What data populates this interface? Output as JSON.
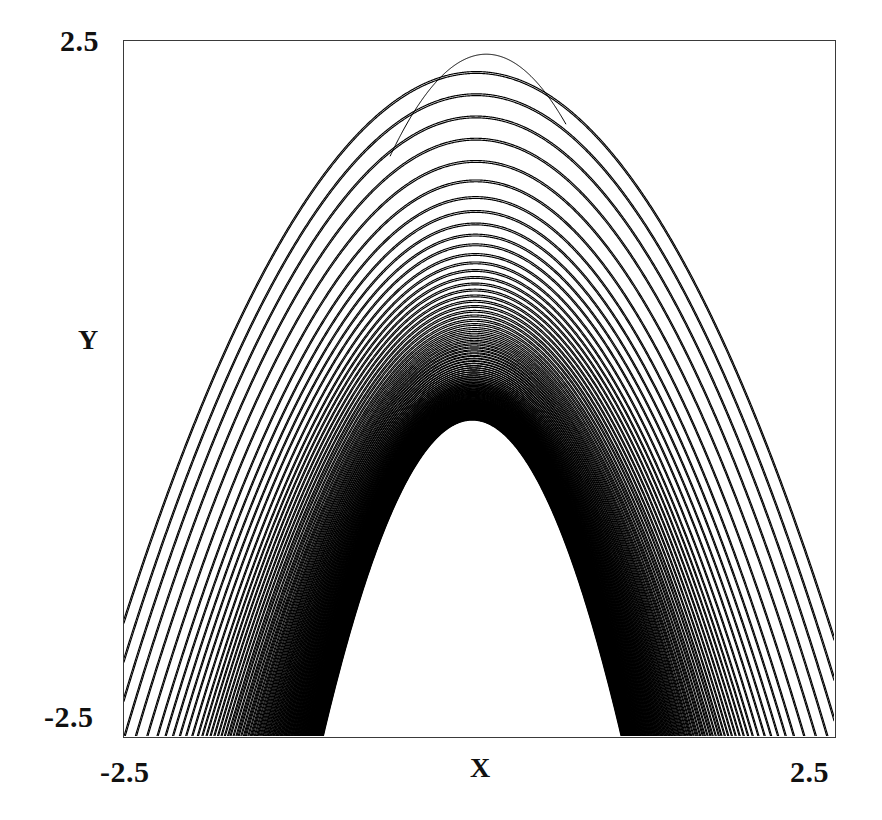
{
  "figure": {
    "background": "#ffffff",
    "frame_color": "#3a3a3a",
    "curve_color": "#000000"
  },
  "axes": {
    "x_label": "X",
    "y_label": "Y",
    "x_min_tick": "-2.5",
    "x_max_tick": "2.5",
    "y_min_tick": "-2.5",
    "y_max_tick": "2.5"
  },
  "chart_data": {
    "type": "line",
    "title": "",
    "xlabel": "X",
    "ylabel": "Y",
    "xlim": [
      -2.5,
      2.5
    ],
    "ylim": [
      -2.5,
      2.5
    ],
    "xticks": [
      -2.5,
      2.5
    ],
    "yticks": [
      -2.5,
      2.5
    ],
    "xticklabels": [
      "-2.5",
      "2.5"
    ],
    "yticklabels": [
      "-2.5",
      "2.5"
    ],
    "grid": false,
    "legend": false,
    "legend_position": "none",
    "line_color": "#000000",
    "line_width": 1.15,
    "series": [
      {
        "name": "contour-family",
        "note": "Each curve is y = apex_y - curvature*(x - vertex_x)^2 with a small shear term; apex_y values listed below in data coordinates.",
        "vertex_x": -0.005,
        "apex_y": [
          2.28,
          2.12,
          1.96,
          1.8,
          1.64,
          1.5,
          1.38,
          1.28,
          1.19,
          1.11,
          1.04,
          0.97,
          0.91,
          0.855,
          0.805,
          0.758,
          0.714,
          0.672,
          0.633,
          0.596,
          0.561,
          0.528,
          0.496,
          0.466,
          0.437,
          0.41,
          0.384,
          0.359,
          0.335,
          0.312,
          0.29,
          0.269,
          0.249,
          0.23,
          0.212,
          0.194,
          0.177,
          0.161,
          0.146,
          0.131,
          0.117,
          0.103,
          0.09,
          0.078,
          0.066,
          0.054,
          0.043,
          0.033,
          0.023,
          0.013,
          0.004,
          -0.005,
          -0.014,
          -0.022,
          -0.03,
          -0.038,
          -0.045,
          -0.052,
          -0.059,
          -0.065,
          -0.072,
          -0.078,
          -0.083,
          -0.089,
          -0.094,
          -0.1,
          -0.105,
          -0.11,
          -0.114,
          -0.119,
          -0.124,
          -0.128,
          -0.132,
          -0.136,
          -0.14,
          -0.144,
          -0.148,
          -0.152,
          -0.156,
          -0.159,
          -0.163,
          -0.166,
          -0.17,
          -0.173,
          -0.176,
          -0.179,
          -0.182,
          -0.185,
          -0.188,
          -0.191,
          -0.194,
          -0.197,
          -0.2,
          -0.202,
          -0.205,
          -0.208,
          -0.21,
          -0.213,
          -0.215,
          -0.218
        ],
        "curvature": [
          0.64,
          0.66,
          0.68,
          0.7,
          0.72,
          0.745,
          0.77,
          0.79,
          0.81,
          0.83,
          0.85,
          0.87,
          0.89,
          0.905,
          0.92,
          0.935,
          0.95,
          0.965,
          0.98,
          0.995,
          1.01,
          1.02,
          1.035,
          1.05,
          1.06,
          1.075,
          1.09,
          1.1,
          1.115,
          1.13,
          1.14,
          1.155,
          1.17,
          1.18,
          1.195,
          1.21,
          1.22,
          1.235,
          1.25,
          1.26,
          1.275,
          1.29,
          1.3,
          1.315,
          1.33,
          1.34,
          1.355,
          1.37,
          1.38,
          1.395,
          1.41,
          1.42,
          1.435,
          1.45,
          1.46,
          1.475,
          1.49,
          1.5,
          1.515,
          1.53,
          1.54,
          1.555,
          1.57,
          1.58,
          1.595,
          1.61,
          1.62,
          1.635,
          1.65,
          1.66,
          1.675,
          1.69,
          1.7,
          1.715,
          1.73,
          1.74,
          1.755,
          1.77,
          1.78,
          1.795,
          1.81,
          1.82,
          1.835,
          1.85,
          1.86,
          1.875,
          1.89,
          1.9,
          1.915,
          1.93,
          1.94,
          1.955,
          1.97,
          1.98,
          1.995,
          2.01,
          2.02,
          2.035,
          2.05,
          2.06
        ]
      }
    ]
  }
}
